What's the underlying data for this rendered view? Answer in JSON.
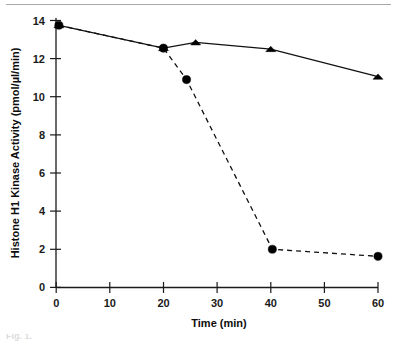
{
  "figure": {
    "caption_fragment": "Fig. 1."
  },
  "chart_data": {
    "type": "line",
    "title": "",
    "xlabel": "Time (min)",
    "ylabel": "Histone H1 Kinase Activity (pmol/µl/min)",
    "ylabel_part1": "Histone H1 Kinase Activity (pmol/",
    "ylabel_mu": "µ",
    "ylabel_part2": "l/min)",
    "xlim": [
      0,
      60
    ],
    "ylim": [
      0,
      14
    ],
    "xticks": [
      0,
      10,
      20,
      30,
      40,
      50,
      60
    ],
    "xtick_labels": [
      "0",
      "10",
      "20",
      "30",
      "40",
      "50",
      "60"
    ],
    "yticks": [
      0,
      2,
      4,
      6,
      8,
      10,
      12,
      14
    ],
    "ytick_labels": [
      "0",
      "2",
      "4",
      "6",
      "8",
      "10",
      "12",
      "14"
    ],
    "grid": false,
    "legend_position": "none",
    "series": [
      {
        "name": "solid-triangle-series",
        "marker": "triangle",
        "line_style": "solid",
        "color": "#000000",
        "x": [
          0.5,
          20,
          26,
          40,
          60
        ],
        "y": [
          13.75,
          12.55,
          12.85,
          12.5,
          11.05
        ]
      },
      {
        "name": "dashed-circle-series",
        "marker": "circle",
        "line_style": "dashed",
        "color": "#000000",
        "x": [
          0.5,
          20,
          24.3,
          40.3,
          60
        ],
        "y": [
          13.75,
          12.55,
          10.9,
          2.0,
          1.63
        ]
      }
    ]
  }
}
